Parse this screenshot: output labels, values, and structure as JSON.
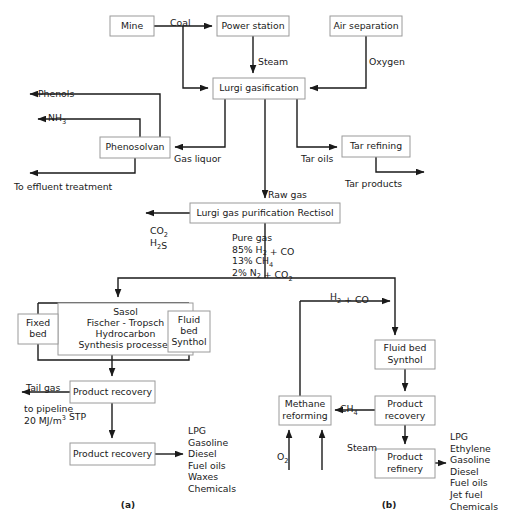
{
  "figure": {
    "captions": [
      {
        "id": "caption-a",
        "text": "(a)",
        "x": 128,
        "y": 508
      },
      {
        "id": "caption-b",
        "text": "(b)",
        "x": 389,
        "y": 508
      }
    ],
    "accent_color": "#1a1a1a",
    "box_stroke_color": "#9a9a9a",
    "box_fill_color": "#ffffff"
  },
  "nodes": [
    {
      "name": "node-mine",
      "label": "Mine",
      "x": 110,
      "y": 16,
      "w": 44,
      "h": 20,
      "lines": [
        "Mine"
      ]
    },
    {
      "name": "node-power-station",
      "label": "Power station",
      "x": 217,
      "y": 16,
      "w": 72,
      "h": 20,
      "lines": [
        "Power station"
      ]
    },
    {
      "name": "node-air-separation",
      "label": "Air separation",
      "x": 330,
      "y": 16,
      "w": 72,
      "h": 20,
      "lines": [
        "Air separation"
      ]
    },
    {
      "name": "node-lurgi-gasification",
      "label": "Lurgi gasification",
      "x": 213,
      "y": 78,
      "w": 92,
      "h": 21,
      "lines": [
        "Lurgi gasification"
      ]
    },
    {
      "name": "node-phenosolvan",
      "label": "Phenosolvan",
      "x": 100,
      "y": 137,
      "w": 70,
      "h": 21,
      "lines": [
        "Phenosolvan"
      ]
    },
    {
      "name": "node-tar-refining",
      "label": "Tar refining",
      "x": 342,
      "y": 136,
      "w": 68,
      "h": 21,
      "lines": [
        "Tar refining"
      ]
    },
    {
      "name": "node-rectisol",
      "label": "Lurgi gas purification Rectisol",
      "x": 190,
      "y": 203,
      "w": 150,
      "h": 20,
      "lines": [
        "Lurgi gas purification Rectisol"
      ]
    },
    {
      "name": "node-sasol-processes",
      "label": "Sasol Fischer - Tropsch Hydrocarbon Synthesis processes",
      "x": 58,
      "y": 303,
      "w": 135,
      "h": 52,
      "lines": [
        "Sasol",
        "Fischer - Tropsch",
        "Hydrocarbon",
        "Synthesis processes"
      ]
    },
    {
      "name": "node-fixed-bed",
      "label": "Fixed bed",
      "x": 18,
      "y": 314,
      "w": 40,
      "h": 30,
      "lines": [
        "Fixed",
        "bed"
      ]
    },
    {
      "name": "node-fluid-bed-synthol-a",
      "label": "Fluid bed Synthol",
      "x": 168,
      "y": 311,
      "w": 42,
      "h": 41,
      "lines": [
        "Fluid",
        "bed",
        "Synthol"
      ]
    },
    {
      "name": "node-product-recovery-a1",
      "label": "Product recovery",
      "x": 70,
      "y": 381,
      "w": 85,
      "h": 22,
      "lines": [
        "Product recovery"
      ]
    },
    {
      "name": "node-product-recovery-a2",
      "label": "Product recovery",
      "x": 70,
      "y": 443,
      "w": 85,
      "h": 22,
      "lines": [
        "Product recovery"
      ]
    },
    {
      "name": "node-fluid-bed-synthol-b",
      "label": "Fluid bed Synthol",
      "x": 375,
      "y": 340,
      "w": 60,
      "h": 29,
      "lines": [
        "Fluid bed",
        "Synthol"
      ]
    },
    {
      "name": "node-product-recovery-b",
      "label": "Product recovery",
      "x": 375,
      "y": 396,
      "w": 60,
      "h": 29,
      "lines": [
        "Product",
        "recovery"
      ]
    },
    {
      "name": "node-methane-reforming",
      "label": "Methane reforming",
      "x": 279,
      "y": 396,
      "w": 52,
      "h": 29,
      "lines": [
        "Methane",
        "reforming"
      ]
    },
    {
      "name": "node-product-refinery",
      "label": "Product refinery",
      "x": 375,
      "y": 449,
      "w": 60,
      "h": 29,
      "lines": [
        "Product",
        "refinery"
      ]
    }
  ],
  "edge_labels": [
    {
      "name": "edge-label-coal",
      "text": "Coal",
      "x": 170,
      "y": 18,
      "anchor": "start"
    },
    {
      "name": "edge-label-steam",
      "text": "Steam",
      "x": 258,
      "y": 57,
      "anchor": "start"
    },
    {
      "name": "edge-label-oxygen",
      "text": "Oxygen",
      "x": 369,
      "y": 57,
      "anchor": "start"
    },
    {
      "name": "edge-label-phenols",
      "text": "Phenols",
      "x": 38,
      "y": 89,
      "anchor": "start"
    },
    {
      "name": "edge-label-gas-liquor",
      "text": "Gas liquor",
      "x": 174,
      "y": 154,
      "anchor": "start"
    },
    {
      "name": "edge-label-tar-oils",
      "text": "Tar oils",
      "x": 301,
      "y": 154,
      "anchor": "start"
    },
    {
      "name": "edge-label-to-effluent",
      "text": "To effluent treatment",
      "x": 14,
      "y": 182,
      "anchor": "start"
    },
    {
      "name": "edge-label-tar-products",
      "text": "Tar products",
      "x": 345,
      "y": 179,
      "anchor": "start"
    },
    {
      "name": "edge-label-raw-gas",
      "text": "Raw gas",
      "x": 268,
      "y": 190,
      "anchor": "start"
    },
    {
      "name": "edge-label-tail-gas",
      "text": "Tail gas",
      "x": 26,
      "y": 383,
      "anchor": "start"
    },
    {
      "name": "edge-label-to-pipeline",
      "text": "to pipeline",
      "x": 24,
      "y": 404,
      "anchor": "start"
    },
    {
      "name": "edge-label-steam-b",
      "text": "Steam",
      "x": 347,
      "y": 443,
      "anchor": "start"
    }
  ],
  "formula_labels": [
    {
      "name": "edge-label-nh3",
      "x": 48,
      "y": 113,
      "parts": [
        {
          "t": "NH",
          "k": "n"
        },
        {
          "t": "3",
          "k": "sub"
        }
      ]
    },
    {
      "name": "edge-label-co2",
      "x": 150,
      "y": 226,
      "parts": [
        {
          "t": "CO",
          "k": "n"
        },
        {
          "t": "2",
          "k": "sub"
        }
      ]
    },
    {
      "name": "edge-label-h2s",
      "x": 150,
      "y": 238,
      "parts": [
        {
          "t": "H",
          "k": "n"
        },
        {
          "t": "2",
          "k": "sub"
        },
        {
          "t": "S",
          "k": "n"
        }
      ]
    },
    {
      "name": "edge-label-h2-co",
      "x": 330,
      "y": 292,
      "parts": [
        {
          "t": "H",
          "k": "n"
        },
        {
          "t": "2",
          "k": "sub"
        },
        {
          "t": " + CO",
          "k": "n"
        }
      ]
    },
    {
      "name": "edge-label-ch4",
      "x": 340,
      "y": 404,
      "parts": [
        {
          "t": "CH",
          "k": "n"
        },
        {
          "t": "4",
          "k": "sub"
        }
      ]
    },
    {
      "name": "edge-label-o2",
      "x": 277,
      "y": 452,
      "parts": [
        {
          "t": "O",
          "k": "n"
        },
        {
          "t": "2",
          "k": "sub"
        }
      ]
    },
    {
      "name": "edge-label-pipeline-value",
      "x": 24,
      "y": 416,
      "parts": [
        {
          "t": "20 MJ/m",
          "k": "n"
        },
        {
          "t": "3",
          "k": "sup"
        },
        {
          "t": " STP",
          "k": "n"
        }
      ]
    }
  ],
  "pure_gas_block": {
    "name": "label-pure-gas",
    "x": 232,
    "y": 233,
    "lines": [
      {
        "parts": [
          {
            "t": "Pure gas",
            "k": "n"
          }
        ]
      },
      {
        "parts": [
          {
            "t": "85% H",
            "k": "n"
          },
          {
            "t": "2",
            "k": "sub"
          },
          {
            "t": " + CO",
            "k": "n"
          }
        ]
      },
      {
        "parts": [
          {
            "t": "13% CH",
            "k": "n"
          },
          {
            "t": "4",
            "k": "sub"
          }
        ]
      },
      {
        "parts": [
          {
            "t": "2% N",
            "k": "n"
          },
          {
            "t": "2",
            "k": "sub"
          },
          {
            "t": " + CO",
            "k": "n"
          },
          {
            "t": "2",
            "k": "sub"
          }
        ]
      }
    ]
  },
  "product_lists": [
    {
      "name": "product-list-a",
      "x": 188,
      "y": 426,
      "items": [
        "LPG",
        "Gasoline",
        "Diesel",
        "Fuel oils",
        "Waxes",
        "Chemicals"
      ]
    },
    {
      "name": "product-list-b",
      "x": 450,
      "y": 432,
      "items": [
        "LPG",
        "Ethylene",
        "Gasoline",
        "Diesel",
        "Fuel oils",
        "Jet fuel",
        "Chemicals"
      ]
    }
  ],
  "edges": [
    {
      "name": "edge-mine-to-power-station",
      "d": "M154,26 L212,26",
      "arrow": "end"
    },
    {
      "name": "edge-coal-to-gasification",
      "d": "M183,26 L183,88 L208,88",
      "arrow": "end"
    },
    {
      "name": "edge-power-station-steam",
      "d": "M253,36 L253,73",
      "arrow": "end"
    },
    {
      "name": "edge-air-separation-oxygen",
      "d": "M366,36 L366,88 L310,88",
      "arrow": "end"
    },
    {
      "name": "edge-gasification-gas-liquor",
      "d": "M225,99 L225,147 L175,147",
      "arrow": "end"
    },
    {
      "name": "edge-gasification-raw-gas",
      "d": "M265,99 L265,198",
      "arrow": "end"
    },
    {
      "name": "edge-gasification-tar-oils",
      "d": "M297,99 L297,147 L337,147",
      "arrow": "end"
    },
    {
      "name": "edge-phenosolvan-phenols",
      "d": "M160,137 L160,94 L30,94",
      "arrow": "end"
    },
    {
      "name": "edge-phenosolvan-nh3",
      "d": "M140,137 L140,119 L38,119",
      "arrow": "end"
    },
    {
      "name": "edge-phenosolvan-effluent",
      "d": "M135,158 L135,173 L30,173",
      "arrow": "end"
    },
    {
      "name": "edge-tar-refining-products",
      "d": "M376,157 L376,172 L424,172",
      "arrow": "end"
    },
    {
      "name": "edge-rectisol-co2-h2s",
      "d": "M190,213 L146,213",
      "arrow": "end"
    },
    {
      "name": "edge-rectisol-pure-gas",
      "d": "M265,223 L265,278",
      "arrow": "none"
    },
    {
      "name": "edge-pure-gas-split-left",
      "d": "M265,278 L118,278 L118,297",
      "arrow": "end"
    },
    {
      "name": "edge-pure-gas-split-right",
      "d": "M265,278 L395,278 L395,335",
      "arrow": "end"
    },
    {
      "name": "edge-sasol-manifold",
      "d": "M38,303 L38,314",
      "arrow": "none"
    },
    {
      "name": "edge-sasol-manifold-top",
      "d": "M38,303 L189,303",
      "arrow": "none"
    },
    {
      "name": "edge-sasol-manifold-right",
      "d": "M189,303 L189,311",
      "arrow": "none"
    },
    {
      "name": "edge-fixed-bed-down",
      "d": "M38,344 L38,360 L112,360",
      "arrow": "none"
    },
    {
      "name": "edge-fluid-bed-down-a",
      "d": "M189,352 L189,360 L112,360",
      "arrow": "none"
    },
    {
      "name": "edge-sasol-to-recovery",
      "d": "M112,355 L112,376",
      "arrow": "end"
    },
    {
      "name": "edge-recovery-tail-gas",
      "d": "M70,392 L22,392",
      "arrow": "end"
    },
    {
      "name": "edge-recovery-to-recovery",
      "d": "M112,403 L112,438",
      "arrow": "end"
    },
    {
      "name": "edge-recovery-products-a",
      "d": "M155,454 L183,454",
      "arrow": "end"
    },
    {
      "name": "edge-h2co-feed",
      "d": "M300,301 L390,301",
      "arrow": "end"
    },
    {
      "name": "edge-synthol-b-down",
      "d": "M405,369 L405,391",
      "arrow": "end"
    },
    {
      "name": "edge-recovery-b-ch4",
      "d": "M375,410 L335,410",
      "arrow": "end"
    },
    {
      "name": "edge-methane-to-h2co",
      "d": "M300,396 L300,301",
      "arrow": "none"
    },
    {
      "name": "edge-o2-in",
      "d": "M289,470 L289,430",
      "arrow": "end"
    },
    {
      "name": "edge-steam-in",
      "d": "M322,470 L322,430",
      "arrow": "end"
    },
    {
      "name": "edge-recovery-b-to-refinery",
      "d": "M405,425 L405,444",
      "arrow": "end"
    },
    {
      "name": "edge-refinery-products-b",
      "d": "M435,463 L446,463",
      "arrow": "end"
    }
  ]
}
